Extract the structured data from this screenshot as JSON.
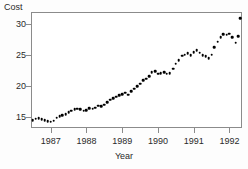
{
  "chart_data": {
    "type": "scatter",
    "title": "",
    "xlabel": "Year",
    "ylabel": "Cost",
    "xlim": [
      1986.45,
      1992.35
    ],
    "ylim": [
      13.2,
      32.0
    ],
    "grid": false,
    "legend": null,
    "xticks": [
      1987,
      1988,
      1989,
      1990,
      1991,
      1992
    ],
    "xtick_labels": [
      "1987",
      "1988",
      "1989",
      "1990",
      "1991",
      "1992"
    ],
    "yticks": [
      15,
      20,
      25,
      30
    ],
    "ytick_labels": [
      "15",
      "20",
      "25",
      "30"
    ],
    "marker": "filled-circle",
    "marker_color": "#000000",
    "axis_color": "#8b8b8b",
    "background_color": "#ffffff",
    "x": [
      1986.5,
      1986.58,
      1986.67,
      1986.75,
      1986.83,
      1986.92,
      1987.0,
      1987.08,
      1987.17,
      1987.25,
      1987.33,
      1987.42,
      1987.5,
      1987.58,
      1987.67,
      1987.75,
      1987.83,
      1987.92,
      1988.0,
      1988.08,
      1988.17,
      1988.25,
      1988.33,
      1988.42,
      1988.5,
      1988.58,
      1988.67,
      1988.75,
      1988.83,
      1988.92,
      1989.0,
      1989.08,
      1989.17,
      1989.25,
      1989.33,
      1989.42,
      1989.5,
      1989.58,
      1989.67,
      1989.75,
      1989.83,
      1989.92,
      1990.0,
      1990.08,
      1990.17,
      1990.25,
      1990.33,
      1990.42,
      1990.5,
      1990.58,
      1990.67,
      1990.75,
      1990.83,
      1990.92,
      1991.0,
      1991.08,
      1991.17,
      1991.25,
      1991.33,
      1991.42,
      1991.5,
      1991.58,
      1991.67,
      1991.75,
      1991.83,
      1991.92,
      1992.0,
      1992.08,
      1992.17,
      1992.25
    ],
    "y": [
      14.5,
      14.7,
      14.8,
      14.6,
      14.5,
      14.3,
      14.2,
      14.4,
      14.9,
      15.1,
      15.3,
      15.4,
      15.8,
      16.0,
      16.2,
      16.3,
      16.2,
      16.0,
      16.1,
      16.4,
      16.3,
      16.5,
      16.8,
      16.7,
      17.0,
      17.4,
      17.8,
      18.0,
      18.3,
      18.5,
      18.7,
      18.9,
      18.6,
      19.2,
      19.6,
      20.0,
      20.4,
      20.9,
      21.2,
      21.6,
      22.2,
      22.4,
      22.0,
      22.1,
      22.2,
      22.0,
      22.1,
      22.8,
      23.6,
      24.2,
      24.9,
      25.1,
      25.3,
      25.0,
      25.5,
      25.8,
      25.4,
      25.0,
      24.8,
      24.5,
      25.1,
      26.3,
      27.2,
      27.9,
      28.4,
      28.3,
      28.5,
      27.9,
      27.0,
      28.1
    ],
    "series_extra_x": [
      1992.3
    ],
    "series_extra_y": [
      31.0
    ]
  }
}
